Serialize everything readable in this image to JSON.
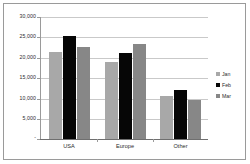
{
  "chart_data": {
    "type": "bar",
    "title": "",
    "xlabel": "",
    "ylabel": "",
    "categories": [
      "USA",
      "Europe",
      "Other"
    ],
    "series": [
      {
        "name": "Jan",
        "color": "#a8a8a8",
        "values": [
          21500,
          19000,
          10500
        ]
      },
      {
        "name": "Feb",
        "color": "#060606",
        "values": [
          25300,
          21200,
          12000
        ]
      },
      {
        "name": "Mar",
        "color": "#878787",
        "values": [
          22600,
          23300,
          9500
        ]
      }
    ],
    "ylim": [
      0,
      30000
    ],
    "ytick_values": [
      30000,
      25000,
      20000,
      15000,
      10000,
      5000,
      0
    ],
    "ytick_labels": [
      "30,000",
      "25,000",
      "20,000",
      "15,000",
      "10,000",
      "5,000",
      "-"
    ],
    "grid": true,
    "grid_axis": "y",
    "legend_position": "right",
    "legend_entries": [
      "Jan",
      "Feb",
      "Mar"
    ],
    "plot_background": "#ffffff",
    "border_color": "#9a9a9a"
  }
}
